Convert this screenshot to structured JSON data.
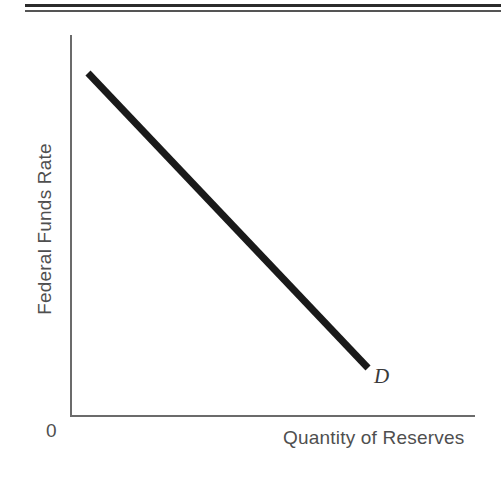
{
  "figure": {
    "background_color": "#ffffff",
    "rules": {
      "thick_color": "#2b2b2b",
      "thin_color": "#555555"
    }
  },
  "chart_data": {
    "type": "line",
    "title": "",
    "subtitle": "",
    "xlabel": "Quantity of Reserves",
    "ylabel": "Federal Funds Rate",
    "origin_label": "0",
    "grid": false,
    "legend_position": "inline-right-of-curve",
    "axis_color": "#6b6b6b",
    "xlim": [
      0,
      1
    ],
    "ylim": [
      0,
      1
    ],
    "xticks": [],
    "yticks": [],
    "xticklabels": [],
    "yticklabels": [],
    "series": [
      {
        "name": "D",
        "label": "D",
        "label_style": "italic",
        "color": "#1a1a1a",
        "linewidth": 7,
        "annotation": "D",
        "x": [
          0.045,
          1.0
        ],
        "y": [
          0.895,
          0.123
        ],
        "points_px": [
          [
            88,
            73
          ],
          [
            368,
            368
          ]
        ]
      }
    ]
  }
}
